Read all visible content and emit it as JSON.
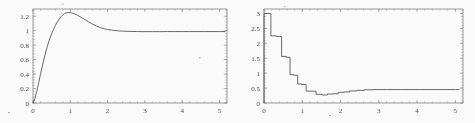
{
  "figure": {
    "panel_count": 2,
    "background_color": "#fefefe",
    "ink_color": "#4a4a4a",
    "axis_color": "#6e6e6e"
  },
  "chart_data": [
    {
      "type": "line",
      "title": "",
      "subtitle": "",
      "xlabel": "",
      "ylabel": "",
      "panel": "left",
      "grid": false,
      "legend": "none",
      "xlim": [
        0,
        5.2
      ],
      "ylim": [
        0,
        1.3
      ],
      "xticks": [
        0,
        1,
        2,
        3,
        4,
        5
      ],
      "xtick_labels": [
        "0",
        "1",
        "2",
        "3",
        "4",
        "5"
      ],
      "yticks": [
        0,
        0.2,
        0.4,
        0.6,
        0.8,
        1,
        1.2
      ],
      "ytick_labels": [
        "0",
        "0.2",
        "0.4",
        "0.6",
        "0.8",
        "1",
        "1.2"
      ],
      "minor_ticks": true,
      "annotations": [],
      "series": [
        {
          "name": "step response",
          "x": [
            0.0,
            0.05,
            0.1,
            0.15,
            0.2,
            0.25,
            0.3,
            0.35,
            0.4,
            0.45,
            0.5,
            0.55,
            0.6,
            0.65,
            0.7,
            0.75,
            0.8,
            0.85,
            0.9,
            0.95,
            1.0,
            1.1,
            1.2,
            1.3,
            1.4,
            1.5,
            1.6,
            1.7,
            1.8,
            1.9,
            2.0,
            2.1,
            2.2,
            2.3,
            2.4,
            2.6,
            2.8,
            3.0,
            3.2,
            3.4,
            3.6,
            3.8,
            4.0,
            4.2,
            4.4,
            4.6,
            4.8,
            5.0,
            5.15
          ],
          "y": [
            0.0,
            0.06,
            0.16,
            0.275,
            0.395,
            0.51,
            0.62,
            0.72,
            0.81,
            0.89,
            0.96,
            1.02,
            1.075,
            1.12,
            1.16,
            1.192,
            1.218,
            1.238,
            1.249,
            1.252,
            1.25,
            1.236,
            1.212,
            1.182,
            1.15,
            1.118,
            1.09,
            1.064,
            1.044,
            1.028,
            1.016,
            1.008,
            1.002,
            0.998,
            0.994,
            0.99,
            0.988,
            0.987,
            0.987,
            0.987,
            0.988,
            0.988,
            0.988,
            0.988,
            0.988,
            0.988,
            0.988,
            0.988,
            0.988
          ]
        }
      ]
    },
    {
      "type": "line",
      "title": "",
      "subtitle": "",
      "xlabel": "",
      "ylabel": "",
      "panel": "right",
      "grid": false,
      "legend": "none",
      "step_plot": true,
      "xlim": [
        0,
        5.2
      ],
      "ylim": [
        0,
        3.15
      ],
      "xticks": [
        0,
        1,
        2,
        3,
        4,
        5
      ],
      "xtick_labels": [
        "0",
        "1",
        "2",
        "3",
        "4",
        "5"
      ],
      "yticks": [
        0,
        0.5,
        1,
        1.5,
        2,
        2.5,
        3
      ],
      "ytick_labels": [
        "0",
        "0.5",
        "1",
        "1.5",
        "2",
        "2.5",
        "3"
      ],
      "minor_ticks": true,
      "annotations": [],
      "series": [
        {
          "name": "piecewise-constant control",
          "x": [
            0.0,
            0.0,
            0.18,
            0.18,
            0.32,
            0.32,
            0.46,
            0.46,
            0.58,
            0.58,
            0.68,
            0.68,
            0.78,
            0.78,
            0.88,
            0.88,
            0.98,
            0.98,
            1.1,
            1.1,
            1.22,
            1.22,
            1.36,
            1.36,
            1.52,
            1.52,
            1.66,
            1.66,
            1.8,
            1.8,
            1.94,
            1.94,
            2.08,
            2.08,
            2.24,
            2.24,
            2.42,
            2.42,
            2.62,
            2.62,
            2.85,
            2.85,
            3.2,
            3.6,
            4.1,
            4.6,
            5.0,
            5.1
          ],
          "y": [
            0.0,
            3.0,
            3.0,
            2.25,
            2.25,
            2.23,
            2.23,
            1.56,
            1.56,
            1.53,
            1.53,
            0.95,
            0.95,
            0.93,
            0.93,
            0.64,
            0.64,
            0.62,
            0.62,
            0.4,
            0.4,
            0.395,
            0.395,
            0.29,
            0.29,
            0.27,
            0.27,
            0.3,
            0.3,
            0.31,
            0.31,
            0.355,
            0.355,
            0.37,
            0.37,
            0.405,
            0.405,
            0.425,
            0.425,
            0.445,
            0.445,
            0.45,
            0.45,
            0.45,
            0.45,
            0.45,
            0.45,
            0.45
          ]
        }
      ]
    }
  ]
}
